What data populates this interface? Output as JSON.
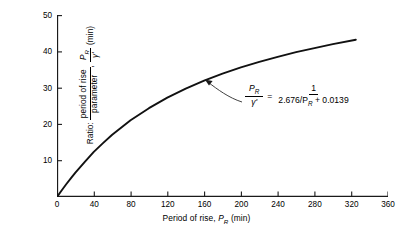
{
  "chart_data": {
    "type": "line",
    "title": "",
    "xlabel": "Period of rise, P_R (min)",
    "ylabel": "Ratio: period of rise / parameter, P_R/γ' (min)",
    "xlim": [
      0,
      360
    ],
    "ylim": [
      0,
      50
    ],
    "xticks": [
      0,
      40,
      80,
      120,
      160,
      200,
      240,
      280,
      320,
      360
    ],
    "yticks": [
      0,
      10,
      20,
      30,
      40,
      50
    ],
    "grid": false,
    "legend": null,
    "x": [
      0,
      5,
      10,
      15,
      20,
      30,
      40,
      50,
      60,
      80,
      100,
      120,
      140,
      160,
      180,
      200,
      220,
      240,
      260,
      280,
      300,
      325
    ],
    "values": [
      0.0,
      1.8,
      3.5,
      5.1,
      6.7,
      9.6,
      12.4,
      14.8,
      17.1,
      21.1,
      24.4,
      27.3,
      29.8,
      32.0,
      33.9,
      35.6,
      37.1,
      38.5,
      39.8,
      40.9,
      42.0,
      43.2
    ],
    "series": [
      {
        "name": "P_R/γ'",
        "values": [
          0.0,
          1.8,
          3.5,
          5.1,
          6.7,
          9.6,
          12.4,
          14.8,
          17.1,
          21.1,
          24.4,
          27.3,
          29.8,
          32.0,
          33.9,
          35.6,
          37.1,
          38.5,
          39.8,
          40.9,
          42.0,
          43.2
        ]
      }
    ],
    "equation": {
      "lhs_numerator": "P",
      "lhs_numerator_sub": "R",
      "lhs_denominator": "γ'",
      "equals": "=",
      "rhs_numerator": "1",
      "rhs_denominator_coeff": "2.676/P",
      "rhs_denominator_sub": "R",
      "rhs_denominator_rest": " + 0.0139",
      "plain": "P_R/γ' = 1 / (2.676/P_R + 0.0139)"
    },
    "annotation_target": {
      "x": 160,
      "y": 33
    }
  },
  "axes": {
    "y_title": {
      "prefix": "Ratio:",
      "frac_numerator": "period of rise",
      "frac_denominator": "parameter",
      "comma": ",",
      "symbol_numerator": "P",
      "symbol_numerator_sub": "R",
      "symbol_denominator": "γ'",
      "units": "(min)"
    },
    "x_title": {
      "text": "Period of rise,",
      "symbol": "P",
      "symbol_sub": "R",
      "units": "(min)"
    },
    "x_tick_labels": [
      "0",
      "40",
      "80",
      "120",
      "160",
      "200",
      "240",
      "280",
      "320",
      "360"
    ],
    "y_tick_labels": [
      "0",
      "10",
      "20",
      "30",
      "40",
      "50"
    ]
  },
  "style": {
    "curve_color": "#111111",
    "axis_color": "#1a1a1a",
    "background": "#ffffff",
    "caption_color": "#b9b9b9"
  },
  "caption": {
    "text": ""
  }
}
